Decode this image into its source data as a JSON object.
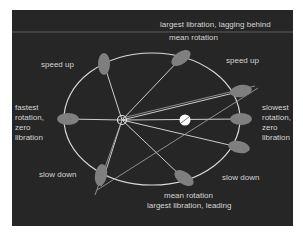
{
  "diagram": {
    "type": "orbit-libration",
    "background_color": "#262626",
    "line_color": "#d9d9d9",
    "body_color": "#7f7f7f",
    "labels": {
      "top_line1": "largest libration, lagging behind",
      "top_line2": "mean rotation",
      "speed_up_left": "speed up",
      "speed_up_right": "speed up",
      "fastest": [
        "fastest",
        "rotation,",
        "zero",
        "libration"
      ],
      "slowest": [
        "slowest",
        "rotation,",
        "zero",
        "libration"
      ],
      "slow_down_left": "slow down",
      "slow_down_right": "slow down",
      "bottom_line1": "mean rotation",
      "bottom_line2": "largest libration, leading"
    },
    "markers": {
      "focus": "open-circle-focus",
      "center_body": "filled-white-circle"
    }
  }
}
